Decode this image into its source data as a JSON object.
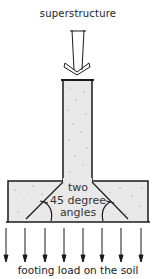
{
  "diagram": {
    "top_label": "superstructure",
    "inner_label_line1": "two",
    "inner_label_line2": "45 degree",
    "inner_label_line3": "angles",
    "bottom_label": "footing load on the soil",
    "colors": {
      "stroke": "#1a1a1a",
      "fill": "#e9e9e9",
      "speckle": "#888888"
    },
    "load_arrow_count": 8
  }
}
